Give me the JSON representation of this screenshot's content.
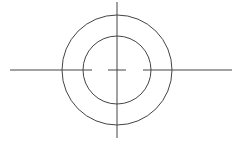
{
  "diagram": {
    "type": "concentric-circles-with-centerlines",
    "center": [
      117,
      70
    ],
    "outer_circle_radius": 55,
    "inner_circle_radius": 34,
    "stroke_color": "#444444",
    "background": "#ffffff",
    "vertical_line": {
      "x": 117,
      "y1": 2,
      "y2": 138
    },
    "horizontal_line_segments": [
      {
        "x1": 10,
        "x2": 92
      },
      {
        "x1": 108,
        "x2": 126
      },
      {
        "x1": 143,
        "x2": 232
      }
    ],
    "horizontal_line_y": 70
  }
}
